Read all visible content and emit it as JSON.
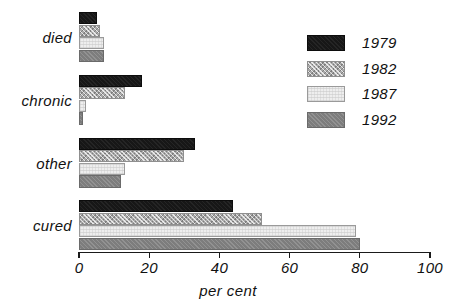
{
  "chart_data": {
    "type": "bar",
    "orientation": "horizontal",
    "title": "",
    "xlabel": "per cent",
    "ylabel": "",
    "xlim": [
      0,
      100
    ],
    "xticks": [
      0,
      20,
      40,
      60,
      80,
      100
    ],
    "xtick_labels": [
      "0",
      "20",
      "40",
      "60",
      "80",
      "100"
    ],
    "grid": false,
    "legend_position": "upper right",
    "categories": [
      "died",
      "chronic",
      "other",
      "cured"
    ],
    "series": [
      {
        "name": "1979",
        "color": "#171717",
        "values": [
          5,
          18,
          33,
          44
        ]
      },
      {
        "name": "1982",
        "color": "#a9a9a9",
        "values": [
          6,
          13,
          30,
          52
        ]
      },
      {
        "name": "1987",
        "color": "#eeeeee",
        "values": [
          7,
          2,
          13,
          79
        ]
      },
      {
        "name": "1992",
        "color": "#7d7d7d",
        "values": [
          7,
          1,
          12,
          80
        ]
      }
    ]
  },
  "legend": {
    "items": [
      {
        "label": "1979"
      },
      {
        "label": "1982"
      },
      {
        "label": "1987"
      },
      {
        "label": "1992"
      }
    ]
  }
}
